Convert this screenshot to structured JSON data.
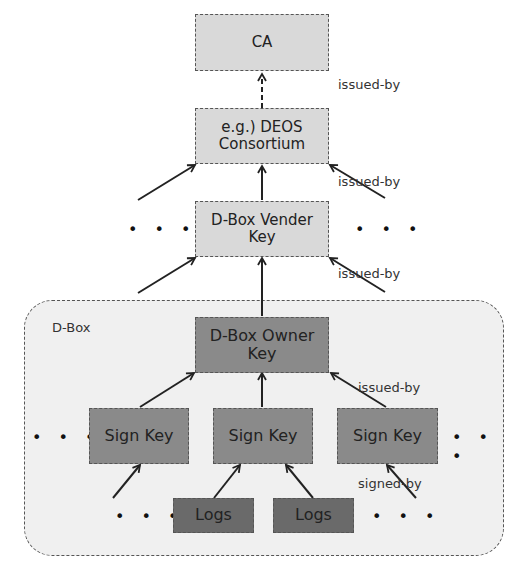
{
  "diagram": {
    "nodes": {
      "ca": "CA",
      "consortium_line1": "e.g.) DEOS",
      "consortium_line2": "Consortium",
      "vender_line1": "D-Box Vender",
      "vender_line2": "Key",
      "owner_line1": "D-Box Owner",
      "owner_line2": "Key",
      "sign_key_1": "Sign Key",
      "sign_key_2": "Sign Key",
      "sign_key_3": "Sign Key",
      "logs_1": "Logs",
      "logs_2": "Logs"
    },
    "container_label": "D-Box",
    "edge_labels": {
      "ca_issued_by": "issued-by",
      "consortium_issued_by": "issued-by",
      "vender_issued_by": "issued-by",
      "owner_issued_by": "issued-by",
      "signed_by": "signed-by"
    },
    "ellipsis": "• • •",
    "colors": {
      "light_node": "#d9d9d9",
      "mid_node": "#8a8a8a",
      "dark_node": "#6a6a6a",
      "container": "#f0f0f0"
    }
  }
}
